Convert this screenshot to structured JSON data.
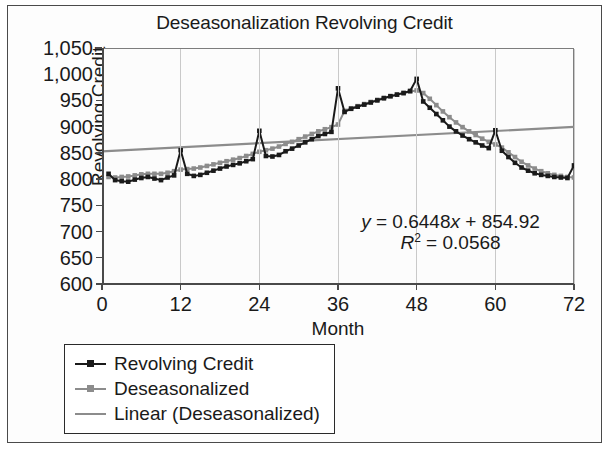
{
  "chart_data": {
    "type": "line",
    "title": "Deseasonalization Revolving Credit",
    "xlabel": "Month",
    "ylabel": "Revolving Credit",
    "xlim": [
      0,
      72
    ],
    "ylim": [
      600,
      1050
    ],
    "xticks": [
      0,
      12,
      24,
      36,
      48,
      60,
      72
    ],
    "xtick_labels": [
      "0",
      "12",
      "24",
      "36",
      "48",
      "60",
      "72"
    ],
    "yticks": [
      600,
      650,
      700,
      750,
      800,
      850,
      900,
      950,
      1000,
      1050
    ],
    "ytick_labels": [
      "600",
      "650",
      "700",
      "750",
      "800",
      "850",
      "900",
      "950",
      "1,000",
      "1,050"
    ],
    "grid": "vertical",
    "legend_position": "below-left",
    "annotations": [
      {
        "name": "trendline-equation",
        "text": "y = 0.6448x + 854.92"
      },
      {
        "name": "r-squared",
        "text": "R² = 0.0568"
      }
    ],
    "trendline": {
      "slope": 0.6448,
      "intercept": 854.92,
      "r_squared": 0.0568
    },
    "colors": {
      "revolving_credit": "#1a1a1a",
      "deseasonalized": "#8c8c8c",
      "linear": "#8c8c8c",
      "gridline": "#c9c9c9",
      "axis": "#4a4a4a"
    },
    "series": [
      {
        "name": "Revolving Credit",
        "color": "#1a1a1a",
        "marker": "square",
        "x": [
          1,
          2,
          3,
          4,
          5,
          6,
          7,
          8,
          9,
          10,
          11,
          12,
          13,
          14,
          15,
          16,
          17,
          18,
          19,
          20,
          21,
          22,
          23,
          24,
          25,
          26,
          27,
          28,
          29,
          30,
          31,
          32,
          33,
          34,
          35,
          36,
          37,
          38,
          39,
          40,
          41,
          42,
          43,
          44,
          45,
          46,
          47,
          48,
          49,
          50,
          51,
          52,
          53,
          54,
          55,
          56,
          57,
          58,
          59,
          60,
          61,
          62,
          63,
          64,
          65,
          66,
          67,
          68,
          69,
          70,
          71,
          72
        ],
        "values": [
          812,
          800,
          798,
          797,
          801,
          804,
          806,
          803,
          800,
          805,
          809,
          857,
          812,
          808,
          810,
          814,
          818,
          822,
          826,
          829,
          832,
          836,
          840,
          894,
          846,
          845,
          848,
          855,
          860,
          866,
          872,
          878,
          884,
          888,
          892,
          975,
          930,
          936,
          940,
          944,
          948,
          952,
          956,
          960,
          963,
          966,
          970,
          993,
          950,
          938,
          926,
          914,
          902,
          893,
          885,
          878,
          872,
          866,
          861,
          895,
          856,
          844,
          833,
          824,
          818,
          813,
          810,
          808,
          806,
          805,
          804,
          828
        ]
      },
      {
        "name": "Deseasonalized",
        "color": "#8c8c8c",
        "marker": "square",
        "x": [
          1,
          2,
          3,
          4,
          5,
          6,
          7,
          8,
          9,
          10,
          11,
          12,
          13,
          14,
          15,
          16,
          17,
          18,
          19,
          20,
          21,
          22,
          23,
          24,
          25,
          26,
          27,
          28,
          29,
          30,
          31,
          32,
          33,
          34,
          35,
          36,
          37,
          38,
          39,
          40,
          41,
          42,
          43,
          44,
          45,
          46,
          47,
          48,
          49,
          50,
          51,
          52,
          53,
          54,
          55,
          56,
          57,
          58,
          59,
          60,
          61,
          62,
          63,
          64,
          65,
          66,
          67,
          68,
          69,
          70,
          71,
          72
        ],
        "values": [
          806,
          805,
          806,
          807,
          809,
          811,
          812,
          812,
          812,
          814,
          817,
          820,
          821,
          822,
          824,
          827,
          830,
          833,
          836,
          839,
          842,
          846,
          850,
          854,
          857,
          860,
          864,
          869,
          873,
          878,
          883,
          888,
          893,
          897,
          901,
          906,
          932,
          937,
          941,
          945,
          949,
          953,
          957,
          960,
          963,
          966,
          969,
          971,
          966,
          955,
          943,
          931,
          920,
          910,
          901,
          893,
          886,
          879,
          873,
          868,
          862,
          853,
          844,
          835,
          828,
          822,
          817,
          813,
          810,
          808,
          806,
          805
        ]
      },
      {
        "name": "Linear (Deseasonalized)",
        "color": "#8c8c8c",
        "marker": "none",
        "type": "trendline",
        "x": [
          0,
          72
        ],
        "values": [
          854.92,
          901.35
        ]
      }
    ]
  },
  "legend": {
    "items": [
      {
        "label": "Revolving Credit",
        "color": "#1a1a1a",
        "marker": "square"
      },
      {
        "label": "Deseasonalized",
        "color": "#8c8c8c",
        "marker": "square"
      },
      {
        "label": "Linear (Deseasonalized)",
        "color": "#8c8c8c",
        "marker": "none"
      }
    ]
  }
}
